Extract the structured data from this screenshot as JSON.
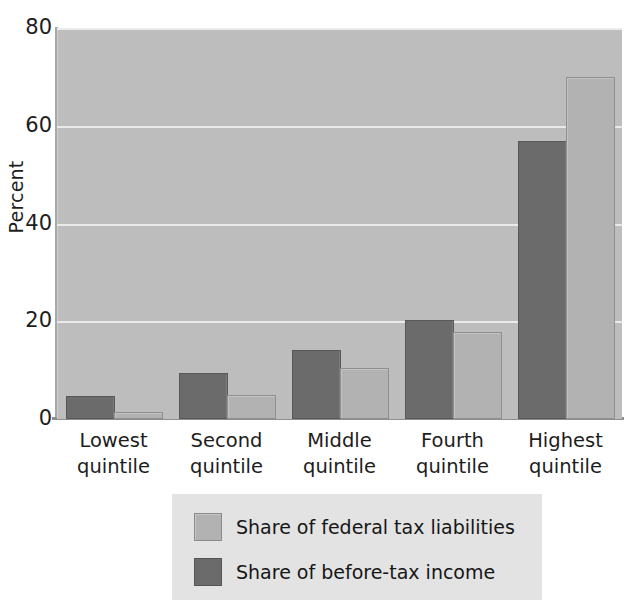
{
  "chart_data": {
    "type": "bar",
    "title": "",
    "xlabel": "",
    "ylabel": "Percent",
    "ylim": [
      0,
      80
    ],
    "yticks": [
      0,
      20,
      40,
      60,
      80
    ],
    "ytick_labels": [
      "0",
      "20",
      "40",
      "60",
      "80"
    ],
    "grid": "horizontal",
    "legend_position": "bottom-center",
    "categories": [
      "Lowest quintile",
      "Second quintile",
      "Middle quintile",
      "Fourth quintile",
      "Highest quintile"
    ],
    "category_lines": [
      [
        "Lowest",
        "quintile"
      ],
      [
        "Second",
        "quintile"
      ],
      [
        "Middle",
        "quintile"
      ],
      [
        "Fourth",
        "quintile"
      ],
      [
        "Highest",
        "quintile"
      ]
    ],
    "series": [
      {
        "name": "Share of before-tax income",
        "color": "#6b6b6b",
        "values": [
          4.2,
          9.0,
          13.7,
          19.8,
          56.5
        ]
      },
      {
        "name": "Share of federal tax liabilities",
        "color": "#b2b2b2",
        "values": [
          1.0,
          4.5,
          10.0,
          17.3,
          69.5
        ]
      }
    ]
  },
  "legend": {
    "entries": [
      {
        "label": "Share of federal tax liabilities",
        "swatch": "light"
      },
      {
        "label": "Share of before-tax income",
        "swatch": "dark"
      }
    ]
  },
  "colors": {
    "plot_background": "#bdbdbd",
    "gridline": "#eeeeee",
    "legend_background": "#e3e3e3",
    "dark_bar": "#6b6b6b",
    "light_bar": "#b2b2b2",
    "text": "#1d1d1d"
  }
}
